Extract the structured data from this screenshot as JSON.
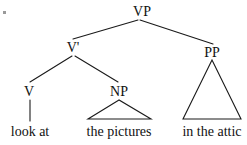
{
  "figure": {
    "kind": "syntax-tree",
    "sentence": "look at the pictures in the attic",
    "ink_color": "#1a1a1a",
    "background_color": "#ffffff"
  },
  "nodes": {
    "vp": {
      "label": "VP",
      "x": 142,
      "y": 16
    },
    "vbar": {
      "label": "V'",
      "x": 73,
      "y": 52
    },
    "pp": {
      "label": "PP",
      "x": 212,
      "y": 57
    },
    "v": {
      "label": "V",
      "x": 29,
      "y": 96
    },
    "np": {
      "label": "NP",
      "x": 119,
      "y": 96
    }
  },
  "leaves": {
    "v_leaf": {
      "text": "look at",
      "x": 30,
      "y": 136
    },
    "np_leaf": {
      "text": "the pictures",
      "x": 119,
      "y": 136
    },
    "pp_leaf": {
      "text": "in the attic",
      "x": 212,
      "y": 136
    }
  },
  "edges": [
    {
      "name": "vp-to-vbar",
      "x1": 138,
      "y1": 20,
      "x2": 73,
      "y2": 39
    },
    {
      "name": "vp-to-pp",
      "x1": 140,
      "y1": 20,
      "x2": 213,
      "y2": 44
    },
    {
      "name": "vbar-to-v",
      "x1": 72,
      "y1": 56,
      "x2": 30,
      "y2": 82
    },
    {
      "name": "vbar-to-np",
      "x1": 75,
      "y1": 56,
      "x2": 118,
      "y2": 82
    },
    {
      "name": "v-to-leaf",
      "x1": 30,
      "y1": 100,
      "x2": 30,
      "y2": 121
    }
  ],
  "triangles": [
    {
      "name": "np-triangle",
      "apex_x": 119,
      "apex_y": 100,
      "left_x": 88,
      "right_x": 151,
      "base_y": 119
    },
    {
      "name": "pp-triangle",
      "apex_x": 212,
      "apex_y": 60,
      "left_x": 183,
      "right_x": 241,
      "base_y": 119
    }
  ],
  "artifact": {
    "name": "scan-speck",
    "x": 3,
    "y": 11,
    "w": 3,
    "h": 3
  }
}
